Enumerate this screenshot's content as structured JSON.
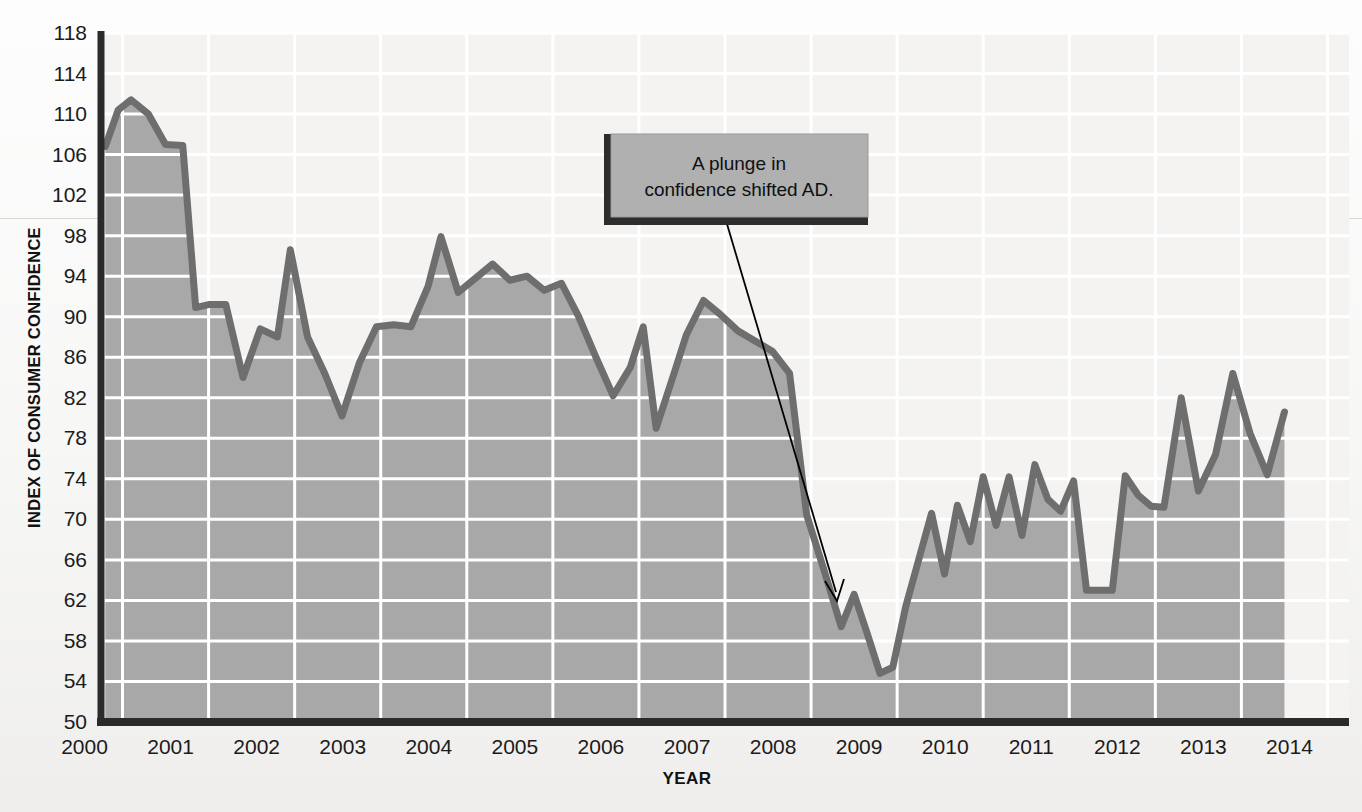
{
  "figure": {
    "title": "",
    "y_axis_title": "INDEX OF CONSUMER CONFIDENCE",
    "x_axis_title": "YEAR"
  },
  "annotation": {
    "line1": "A plunge in",
    "line2": "confidence shifted AD."
  },
  "colors": {
    "area_fill": "#a8a8a8",
    "line": "#6e6e6e",
    "gridline": "#ffffff",
    "axis": "#2a2a2a",
    "callout_fill": "#b0b0b0",
    "callout_shadow": "#2d2d2d",
    "leader_line": "#000000",
    "page_background": "#f6f5f3"
  },
  "chart_data": {
    "type": "area",
    "title": "Index of Consumer Confidence",
    "xlabel": "YEAR",
    "ylabel": "INDEX OF CONSUMER CONFIDENCE",
    "xlim": [
      1999.75,
      2014.25
    ],
    "ylim": [
      50,
      118
    ],
    "ytick_step": 4,
    "yticks": [
      50,
      54,
      58,
      62,
      66,
      70,
      74,
      78,
      82,
      86,
      90,
      94,
      98,
      102,
      106,
      110,
      114,
      118
    ],
    "xticks": [
      2000,
      2001,
      2002,
      2003,
      2004,
      2005,
      2006,
      2007,
      2008,
      2009,
      2010,
      2011,
      2012,
      2013,
      2014
    ],
    "grid": true,
    "legend": null,
    "series": [
      {
        "name": "Index of Consumer Confidence",
        "x": [
          1999.8,
          1999.95,
          2000.1,
          2000.3,
          2000.5,
          2000.7,
          2000.85,
          2001.0,
          2001.2,
          2001.4,
          2001.6,
          2001.8,
          2001.95,
          2002.15,
          2002.35,
          2002.55,
          2002.75,
          2002.95,
          2003.15,
          2003.35,
          2003.55,
          2003.7,
          2003.9,
          2004.1,
          2004.3,
          2004.5,
          2004.7,
          2004.9,
          2005.1,
          2005.3,
          2005.5,
          2005.7,
          2005.9,
          2006.05,
          2006.2,
          2006.4,
          2006.55,
          2006.75,
          2006.95,
          2007.15,
          2007.35,
          2007.55,
          2007.75,
          2007.95,
          2008.15,
          2008.35,
          2008.5,
          2008.65,
          2008.8,
          2008.95,
          2009.1,
          2009.25,
          2009.4,
          2009.55,
          2009.7,
          2009.85,
          2010.0,
          2010.15,
          2010.3,
          2010.45,
          2010.6,
          2010.75,
          2010.9,
          2011.05,
          2011.2,
          2011.35,
          2011.5,
          2011.65,
          2011.8,
          2011.95,
          2012.1,
          2012.3,
          2012.5,
          2012.7,
          2012.9,
          2013.1,
          2013.3,
          2013.5
        ],
        "y": [
          106.8,
          110.4,
          111.4,
          110.0,
          107.0,
          106.9,
          90.9,
          91.2,
          91.2,
          84.0,
          88.8,
          88.0,
          96.6,
          88.0,
          84.4,
          80.2,
          85.4,
          89.0,
          89.2,
          89.0,
          93.0,
          97.9,
          92.4,
          93.8,
          95.2,
          93.6,
          94.0,
          92.6,
          93.3,
          90.0,
          86.0,
          82.2,
          85.0,
          89.0,
          79.0,
          84.2,
          88.2,
          91.6,
          90.2,
          88.6,
          87.6,
          86.6,
          84.4,
          70.4,
          65.0,
          59.4,
          62.6,
          58.8,
          54.8,
          55.4,
          61.4,
          66.0,
          70.6,
          64.6,
          71.4,
          67.8,
          74.2,
          69.4,
          74.2,
          68.4,
          75.4,
          72.0,
          70.8,
          73.8,
          63.0,
          63.0,
          63.0,
          74.3,
          72.4,
          71.3,
          71.2,
          82.0,
          72.8,
          76.4,
          84.4,
          78.5,
          74.4,
          80.6
        ]
      }
    ],
    "annotations": [
      {
        "text": "A plunge in confidence shifted AD.",
        "point_x": 2008.58,
        "point_y": 62.0
      }
    ]
  }
}
